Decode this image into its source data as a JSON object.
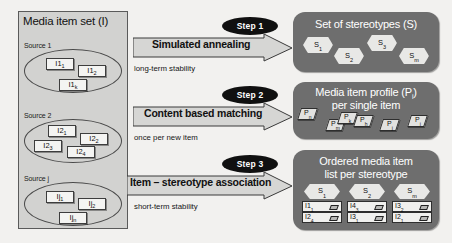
{
  "diagram": {
    "media_set": {
      "title": "Media item set (I)",
      "sources": [
        {
          "label": "Source 1",
          "items": [
            "I1",
            "I1",
            "I1"
          ],
          "subs": [
            "1",
            "2",
            "k"
          ]
        },
        {
          "label": "Source 2",
          "items": [
            "I2",
            "I2",
            "I2",
            "I2"
          ],
          "subs": [
            "1",
            "2",
            "3",
            "4"
          ]
        },
        {
          "label": "Source j",
          "items": [
            "Ij",
            "Ij",
            "Ij"
          ],
          "subs": [
            "1",
            "2",
            "n"
          ]
        }
      ]
    },
    "steps": [
      {
        "badge": "Step 1",
        "label": "Simulated annealing",
        "note": "long-term stability"
      },
      {
        "badge": "Step 2",
        "label": "Content based matching",
        "note": "once per new item"
      },
      {
        "badge": "Step 3",
        "label": "Item – stereotype association",
        "note": "short-term stability"
      }
    ],
    "panels": [
      {
        "name": "stereotype-set",
        "title_lines": [
          "Set of stereotypes (S)"
        ],
        "hexagons": [
          {
            "base": "S",
            "sub": "1"
          },
          {
            "base": "S",
            "sub": "2"
          },
          {
            "base": "S",
            "sub": "3"
          },
          {
            "base": "S",
            "sub": "m"
          }
        ]
      },
      {
        "name": "media-item-profile",
        "title_lines": [
          "Media item profile (P",
          "per single item"
        ],
        "title_full": "Media item profile (Pᵢ) per single item",
        "profiles": [
          {
            "base": "P",
            "sub": "n"
          },
          {
            "base": "P",
            "sub": "m"
          },
          {
            "base": "P",
            "sub": "k"
          },
          {
            "base": "P",
            "sub": "h"
          },
          {
            "base": "P",
            "sub": "j"
          },
          {
            "base": "P",
            "sub": "i"
          }
        ]
      },
      {
        "name": "ordered-media-item-list",
        "title_lines": [
          "Ordered media item",
          "list per stereotype"
        ],
        "columns": [
          {
            "stereotype": {
              "base": "S",
              "sub": "1"
            },
            "items": [
              {
                "base": "I1",
                "sub": "1"
              },
              {
                "base": "I2",
                "sub": "4"
              }
            ]
          },
          {
            "stereotype": {
              "base": "S",
              "sub": "2"
            },
            "items": [
              {
                "base": "I4",
                "sub": "3"
              },
              {
                "base": "I3",
                "sub": "1"
              }
            ]
          },
          {
            "stereotype": {
              "base": "S",
              "sub": "m"
            },
            "items": [
              {
                "base": "I3",
                "sub": "2"
              },
              {
                "base": "I2",
                "sub": "1"
              }
            ]
          }
        ]
      }
    ],
    "colors": {
      "panel_fill": "#6e6e6e",
      "media_set_fill": "#d2d2d0",
      "badge_fill": "#101010",
      "arrow_fill": "#d6d6d4",
      "page_background": "#f2f1ef"
    }
  }
}
